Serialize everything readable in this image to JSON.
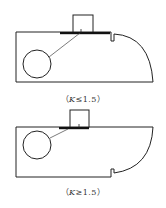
{
  "figure": {
    "panels": [
      {
        "id": "top",
        "caption_open": "（",
        "caption_var": "K",
        "caption_rel": "≤1.5",
        "caption_close": "）"
      },
      {
        "id": "bottom",
        "caption_open": "（",
        "caption_var": "K",
        "caption_rel": "≥1.5",
        "caption_close": "）"
      }
    ],
    "colors": {
      "stroke": "#222222",
      "background": "#ffffff"
    }
  }
}
